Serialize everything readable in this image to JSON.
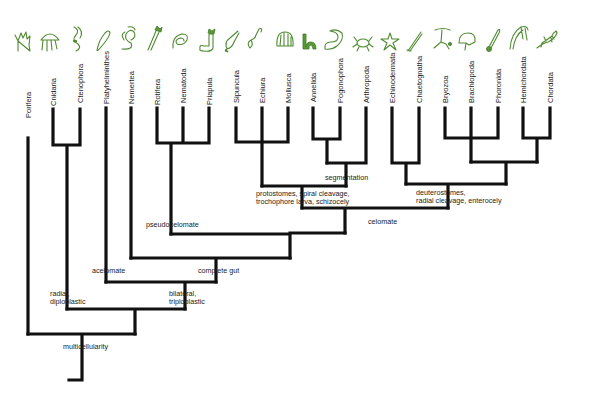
{
  "colors": {
    "branch": "#111111",
    "icon_green": "#4e8a30",
    "background": "#ffffff"
  },
  "taxa": [
    {
      "name": "Porifera",
      "x": 28,
      "icon": "sponge-icon"
    },
    {
      "name": "Cnidaria",
      "x": 53,
      "icon": "jellyfish-icon"
    },
    {
      "name": "Ctenophora",
      "x": 80,
      "icon": "comb-jelly-icon"
    },
    {
      "name": "Platyhelminthes",
      "x": 106,
      "icon": "flatworm-icon"
    },
    {
      "name": "Nemertea",
      "x": 131,
      "icon": "ribbon-worm-icon"
    },
    {
      "name": "Rotifera",
      "x": 157,
      "icon": "rotifer-icon"
    },
    {
      "name": "Nematoda",
      "x": 183,
      "icon": "roundworm-icon"
    },
    {
      "name": "Priapula",
      "x": 209,
      "icon": "priapulid-icon"
    },
    {
      "name": "Sipuncula",
      "x": 236,
      "icon": "peanut-worm-icon"
    },
    {
      "name": "Echiura",
      "x": 262,
      "icon": "spoon-worm-icon"
    },
    {
      "name": "Mollusca",
      "x": 288,
      "icon": "shell-icon"
    },
    {
      "name": "Annelida",
      "x": 313,
      "icon": "earthworm-icon"
    },
    {
      "name": "Pogonophora",
      "x": 340,
      "icon": "beard-worm-icon"
    },
    {
      "name": "Arthropoda",
      "x": 366,
      "icon": "crab-icon"
    },
    {
      "name": "Echinodermata",
      "x": 392,
      "icon": "starfish-icon"
    },
    {
      "name": "Chaetognatha",
      "x": 419,
      "icon": "arrow-worm-icon"
    },
    {
      "name": "Bryozoa",
      "x": 445,
      "icon": "bryozoan-icon"
    },
    {
      "name": "Brachiopoda",
      "x": 471,
      "icon": "lamp-shell-icon"
    },
    {
      "name": "Phoronida",
      "x": 498,
      "icon": "horseshoe-worm-icon"
    },
    {
      "name": "Hemichordata",
      "x": 523,
      "icon": "acorn-worm-icon"
    },
    {
      "name": "Chordata",
      "x": 550,
      "icon": "salamander-icon"
    }
  ],
  "node_labels": {
    "segmentation": "segmentation",
    "protostomes_1": "protostomes, spiral cleavage,",
    "protostomes_2": "trochophore larva, schizocely",
    "deuterostomes_1": "deuterostomes,",
    "deuterostomes_2": "radial cleavage, enterocely",
    "coelomate": "celomate",
    "pseudocoelomate": "pseudocelomate",
    "complete_gut": "complete gut",
    "acoelomate": "acelomate",
    "bilateral_1": "bilateral,",
    "bilateral_2": "triploblastic",
    "radial_1": "radial,",
    "radial_2": "diploblastic",
    "multicellularity": "multicellularity"
  }
}
